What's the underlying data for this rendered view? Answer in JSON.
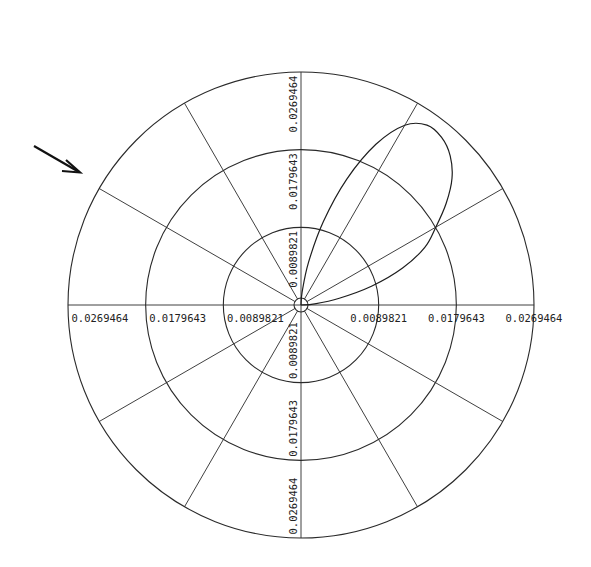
{
  "chart_data": {
    "type": "polar-line",
    "title": "",
    "radial_axis": {
      "ticks": [
        0.0089821,
        0.0179643,
        0.0269464
      ],
      "tick_labels": [
        "0.0089821",
        "0.0179643",
        "0.0269464"
      ],
      "range": [
        0,
        0.0269464
      ]
    },
    "angular_grid_deg": [
      0,
      30,
      60,
      90,
      120,
      150,
      180,
      210,
      240,
      270,
      300,
      330
    ],
    "center_circle": true,
    "series": [
      {
        "name": "lobe",
        "theta_deg": [
          0,
          5,
          10,
          15,
          20,
          25,
          30,
          35,
          40,
          45,
          50,
          55,
          60,
          65,
          70,
          75,
          80,
          85,
          90
        ],
        "r": [
          0.0,
          0.0016,
          0.0045,
          0.0085,
          0.0125,
          0.0158,
          0.018,
          0.0205,
          0.0228,
          0.0244,
          0.0253,
          0.0254,
          0.024,
          0.0205,
          0.0155,
          0.01,
          0.005,
          0.0015,
          0.0
        ]
      }
    ],
    "annotations": [
      {
        "type": "arrow",
        "direction": "pointing down-right toward plot"
      }
    ]
  },
  "labels": {
    "top": [
      "0.0089821",
      "0.0179643",
      "0.0269464"
    ],
    "bottom": [
      "0.0089821",
      "0.0179643",
      "0.0269464"
    ],
    "left": [
      "0.0089821",
      "0.0179643",
      "0.0269464"
    ],
    "right": [
      "0.0089821",
      "0.0179643",
      "0.0269464"
    ]
  }
}
